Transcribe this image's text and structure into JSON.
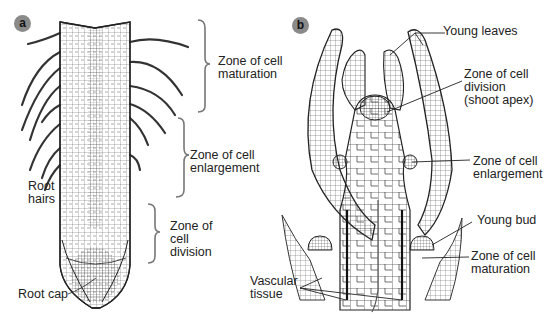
{
  "panels": [
    {
      "id": "a",
      "badge": "a",
      "subject": "root tip",
      "labels": {
        "zone_maturation": "Zone of cell\nmaturation",
        "zone_enlargement": "Zone of cell\nenlargement",
        "zone_division": "Zone of\ncell\ndivision",
        "root_hairs": "Root\nhairs",
        "root_cap": "Root cap"
      }
    },
    {
      "id": "b",
      "badge": "b",
      "subject": "shoot tip",
      "labels": {
        "young_leaves": "Young leaves",
        "zone_division": "Zone of cell\ndivision\n(shoot apex)",
        "zone_enlargement": "Zone of cell\nenlargement",
        "young_bud": "Young bud",
        "zone_maturation": "Zone of cell\nmaturation",
        "vascular_tissue": "Vascular\ntissue"
      }
    }
  ],
  "colors": {
    "badge_fill": "#8a8a8a",
    "line": "#222222",
    "bracket": "#777777",
    "background": "#ffffff"
  }
}
